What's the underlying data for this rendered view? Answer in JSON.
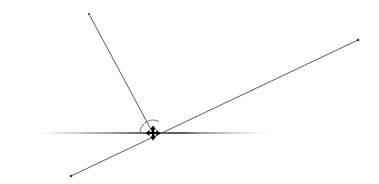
{
  "canvas": {
    "width": 379,
    "height": 184,
    "background_color": "#ffffff",
    "title": "Intersecting lines angle diagram"
  },
  "colors": {
    "line_stroke": "#4a4a4a",
    "axis_stroke": "#3c3c3c",
    "arc_stroke": "#555555",
    "cursor_fill": "#000000",
    "endpoint_fill": "#333333",
    "emphasis_stroke": "#1e1e1e"
  },
  "geometry": {
    "intersection_point": {
      "x": 153,
      "y": 133,
      "label": "vertex"
    },
    "elements": [
      {
        "name": "horizontal-baseline",
        "type": "tapered-line",
        "x1": 30,
        "y1": 133,
        "x2": 277,
        "y2": 133,
        "max_thickness": 2.6,
        "note": "lens/spindle shaped horizontal reference line, fades at both ends"
      },
      {
        "name": "steep-line",
        "type": "line",
        "x1": 89,
        "y1": 14,
        "x2": 155,
        "y2": 137,
        "stroke_width": 0.9
      },
      {
        "name": "diagonal-line",
        "type": "line",
        "x1": 71,
        "y1": 176,
        "x2": 358,
        "y2": 40,
        "stroke_width": 0.9
      },
      {
        "name": "angle-arc",
        "type": "arc",
        "center_x": 153,
        "center_y": 133,
        "radius": 13,
        "start_angle_deg": 180,
        "end_angle_deg": 62,
        "stroke_width": 0.8
      },
      {
        "name": "emphasis-segment-right",
        "type": "tapered-line",
        "x1": 163,
        "y1": 133,
        "x2": 205,
        "y2": 133,
        "max_thickness": 2.2
      }
    ],
    "endpoints": [
      {
        "name": "endpoint-top-left",
        "x": 89,
        "y": 14,
        "radius": 0.9
      },
      {
        "name": "endpoint-upper-right",
        "x": 358,
        "y": 40,
        "radius": 1.3
      },
      {
        "name": "endpoint-bottom-left",
        "x": 71,
        "y": 176,
        "radius": 1.3
      }
    ],
    "cursor": {
      "name": "move-cursor",
      "kind": "four-pointed-move-arrow",
      "x": 153,
      "y": 133,
      "size": 14,
      "color": "#000000"
    }
  }
}
